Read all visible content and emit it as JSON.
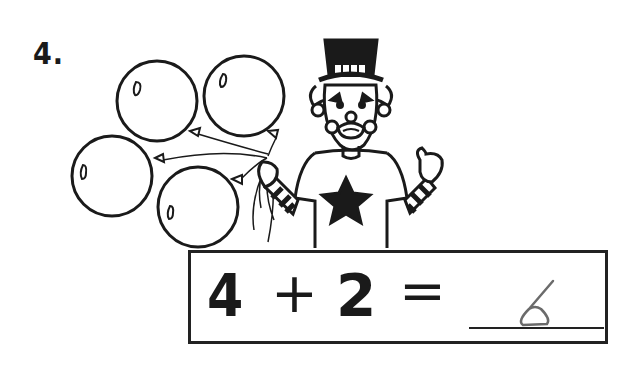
{
  "problem": {
    "number_label": "4.",
    "illustration": {
      "description": "Clown in top hat with star shirt holding 4 balloons",
      "balloon_count": 4
    },
    "equation": {
      "operand_a": "4",
      "operator": "+",
      "operand_b": "2",
      "equals": "=",
      "handwritten_answer": "6"
    }
  },
  "colors": {
    "ink": "#1a1a1a",
    "pencil": "#6b6b6b",
    "background": "#ffffff"
  }
}
